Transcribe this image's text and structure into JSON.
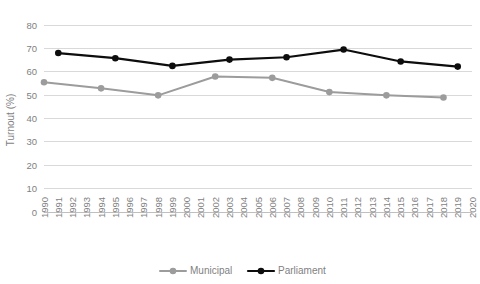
{
  "chart_data": {
    "type": "line",
    "title": "",
    "xlabel": "",
    "ylabel": "Turnout (%)",
    "ylim": [
      0,
      80
    ],
    "ytick_step": 10,
    "yticks": [
      "0",
      "10",
      "20",
      "30",
      "40",
      "50",
      "60",
      "70",
      "80"
    ],
    "xlim": [
      1990,
      2020
    ],
    "x": [
      "1990",
      "1991",
      "1992",
      "1993",
      "1994",
      "1995",
      "1996",
      "1997",
      "1998",
      "1999",
      "2000",
      "2001",
      "2002",
      "2003",
      "2004",
      "2005",
      "2006",
      "2007",
      "2008",
      "2009",
      "2010",
      "2011",
      "2012",
      "2013",
      "2014",
      "2015",
      "2016",
      "2017",
      "2018",
      "2019",
      "2020"
    ],
    "grid": "horizontal",
    "legend_position": "bottom",
    "series": [
      {
        "name": "Municipal",
        "color": "#9c9c9c",
        "marker": "circle",
        "points": [
          {
            "x": "1990",
            "y": 55.5
          },
          {
            "x": "1994",
            "y": 52.9
          },
          {
            "x": "1998",
            "y": 49.9
          },
          {
            "x": "2002",
            "y": 58.0
          },
          {
            "x": "2006",
            "y": 57.4
          },
          {
            "x": "2010",
            "y": 51.3
          },
          {
            "x": "2014",
            "y": 49.9
          },
          {
            "x": "2018",
            "y": 49.0
          }
        ]
      },
      {
        "name": "Parliament",
        "color": "#0d0d0d",
        "marker": "circle",
        "points": [
          {
            "x": "1991",
            "y": 68.0
          },
          {
            "x": "1995",
            "y": 65.8
          },
          {
            "x": "1999",
            "y": 62.5
          },
          {
            "x": "2003",
            "y": 65.2
          },
          {
            "x": "2007",
            "y": 66.2
          },
          {
            "x": "2011",
            "y": 69.5
          },
          {
            "x": "2015",
            "y": 64.4
          },
          {
            "x": "2019",
            "y": 62.2
          }
        ]
      }
    ]
  },
  "legend": {
    "items": [
      {
        "label": "Municipal",
        "color": "#9c9c9c"
      },
      {
        "label": "Parliament",
        "color": "#0d0d0d"
      }
    ]
  },
  "axis": {
    "y_title": "Turnout (%)"
  }
}
